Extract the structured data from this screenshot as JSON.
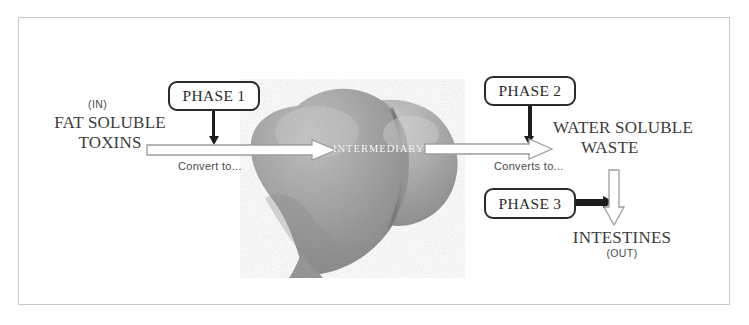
{
  "diagram": {
    "frame": {
      "border_color": "#c9c9c9"
    },
    "organ": {
      "name": "liver",
      "label": "INTERMEDIARY",
      "fill_color": "#a9a9a9",
      "shadow_color": "#8a8a8a"
    },
    "inputs": {
      "in_marker": "(IN)",
      "substance_line1": "FAT SOLUBLE",
      "substance_line2": "TOXINS"
    },
    "outputs": {
      "waste_line1": "WATER SOLUBLE",
      "waste_line2": "WASTE",
      "destination": "INTESTINES",
      "out_marker": "(OUT)"
    },
    "phases": [
      {
        "id": "phase-1",
        "label": "PHASE 1"
      },
      {
        "id": "phase-2",
        "label": "PHASE 2"
      },
      {
        "id": "phase-3",
        "label": "PHASE 3"
      }
    ],
    "transitions": {
      "convert_to": "Convert to...",
      "converts_to": "Converts to..."
    },
    "colors": {
      "ink": "#2b2b2b",
      "text": "#3b3b3b",
      "arrow_outline": "#9a9a9a",
      "arrow_fill": "#ffffff",
      "solid_arrow": "#1d1d1d"
    }
  }
}
